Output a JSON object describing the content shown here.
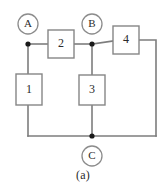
{
  "figure": {
    "caption": "(a)",
    "type": "circuit-diagram",
    "colors": {
      "wire": "#7d7d7d",
      "box_stroke": "#868686",
      "node": "#1a1a1a",
      "text": "#2b2b2b",
      "background": "#ffffff"
    }
  },
  "components": [
    {
      "id": "box1",
      "label": "1",
      "x": 16,
      "y": 74,
      "w": 26,
      "h": 31
    },
    {
      "id": "box2",
      "label": "2",
      "x": 48,
      "y": 30,
      "w": 26,
      "h": 28
    },
    {
      "id": "box3",
      "label": "3",
      "x": 79,
      "y": 75,
      "w": 26,
      "h": 30
    },
    {
      "id": "box4",
      "label": "4",
      "x": 113,
      "y": 26,
      "w": 26,
      "h": 28
    }
  ],
  "terminals": [
    {
      "id": "terminalA",
      "label": "A",
      "cx": 28,
      "cy": 24,
      "r": 10
    },
    {
      "id": "terminalB",
      "label": "B",
      "cx": 92,
      "cy": 24,
      "r": 10
    },
    {
      "id": "terminalC",
      "label": "C",
      "cx": 92,
      "cy": 156,
      "r": 10
    }
  ],
  "nodes": [
    {
      "id": "nodeA",
      "cx": 28,
      "cy": 44,
      "r": 2.6
    },
    {
      "id": "nodeB",
      "cx": 92,
      "cy": 44,
      "r": 2.6
    },
    {
      "id": "nodeC",
      "cx": 92,
      "cy": 136,
      "r": 2.6
    }
  ],
  "wires": [
    {
      "id": "wire-a-to-box2",
      "d": "M 28 44 L 48 44"
    },
    {
      "id": "wire-box2-to-b",
      "d": "M 74 44 L 92 44"
    },
    {
      "id": "wire-b-to-box4",
      "d": "M 92 44 L 113 40"
    },
    {
      "id": "wire-box4-right-down",
      "d": "M 139 40 L 156 40 L 156 136"
    },
    {
      "id": "wire-a-down-to-box1",
      "d": "M 28 44 L 28 74"
    },
    {
      "id": "wire-box1-down-to-bottom",
      "d": "M 28 105 L 28 136"
    },
    {
      "id": "wire-b-down-to-box3",
      "d": "M 92 44 L 92 75"
    },
    {
      "id": "wire-box3-down-to-bottom",
      "d": "M 92 105 L 92 136"
    },
    {
      "id": "wire-bottom-rail",
      "d": "M 28 136 L 156 136"
    }
  ]
}
